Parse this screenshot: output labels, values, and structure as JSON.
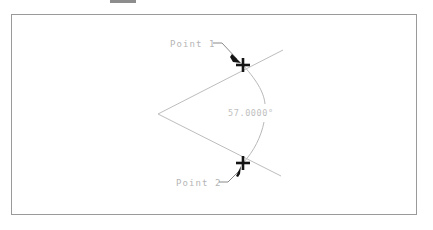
{
  "drawing": {
    "title": "Angular dimension between two points",
    "frame": {
      "border_color": "#9a9a9a",
      "background": "#ffffff"
    },
    "top_bar_fragment": {
      "color": "#8d8d8d"
    },
    "annotations": {
      "point1_label": "Point 1",
      "point2_label": "Point 2",
      "angle_value": "57.0000°"
    },
    "colors": {
      "geometry": "#bdbdbd",
      "arc": "#b8b8b8",
      "leader": "#8a8a8a",
      "marker": "#141414",
      "text": "#b5b5b5",
      "angle_text": "#c0c0c0"
    },
    "markers": [
      {
        "name": "point-1-marker",
        "x": 243,
        "y": 65
      },
      {
        "name": "point-2-marker",
        "x": 243,
        "y": 163
      }
    ],
    "vertex": {
      "x": 158,
      "y": 114
    }
  }
}
